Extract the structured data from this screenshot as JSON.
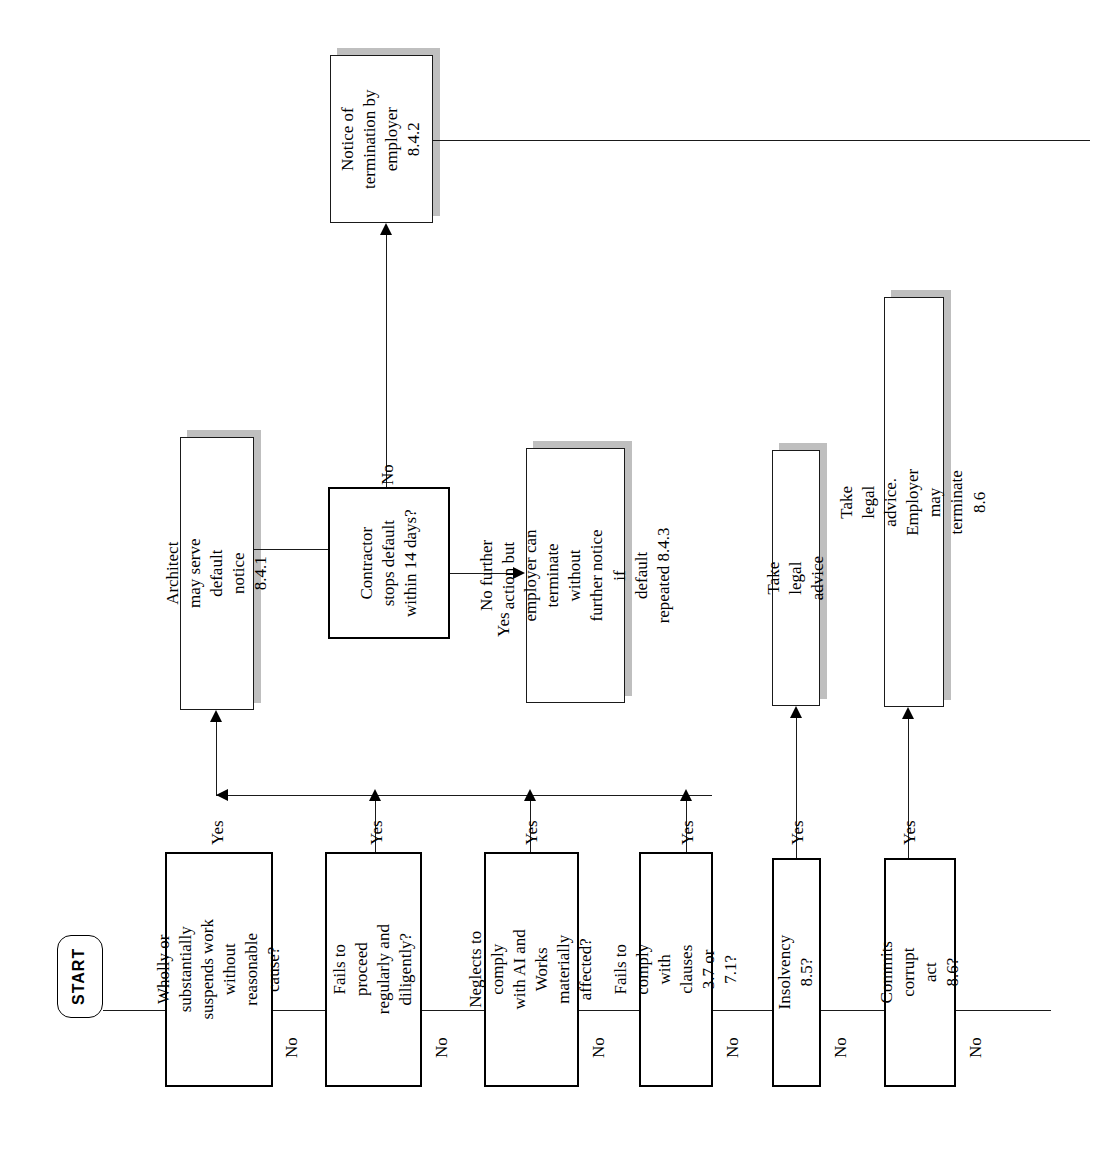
{
  "diagram": {
    "orientation": "landscape-rotated-text",
    "colors": {
      "stroke": "#1a1a1a",
      "shadow": "#bfbfbf",
      "background": "#ffffff",
      "text": "#000000"
    }
  },
  "nodes": {
    "start": {
      "label": "START",
      "shape": "terminator"
    },
    "notice_termination": {
      "label": "Notice of\ntermination by\nemployer 8.4.2",
      "shape": "process"
    },
    "architect_default_notice": {
      "label": "Architect may serve default\nnotice 8.4.1",
      "shape": "process"
    },
    "contractor_stops": {
      "label": "Contractor\nstops default\nwithin 14 days?",
      "shape": "question"
    },
    "no_further_action": {
      "label": "No further action but\nemployer can terminate\nwithout further notice if\ndefault repeated 8.4.3",
      "shape": "process"
    },
    "take_legal_advice": {
      "label": "Take legal advice",
      "shape": "process"
    },
    "take_legal_advice_terminate": {
      "label": "Take legal advice. Employer may terminate\n8.6",
      "shape": "process"
    },
    "q_suspends_work": {
      "label": "Wholly or substantially\nsuspends work without\nreasonable cause?",
      "shape": "decision"
    },
    "q_fails_proceed": {
      "label": "Fails to proceed\nregularly and\ndiligently?",
      "shape": "decision"
    },
    "q_neglects_ai": {
      "label": "Neglects to comply\nwith AI and Works\nmaterially affected?",
      "shape": "decision"
    },
    "q_fails_clauses": {
      "label": "Fails to comply with\nclauses 3.7 or 7.1?",
      "shape": "decision"
    },
    "q_insolvency": {
      "label": "Insolvency 8.5?",
      "shape": "decision"
    },
    "q_corrupt_act": {
      "label": "Commits corrupt act\n8.6?",
      "shape": "decision"
    }
  },
  "edge_labels": {
    "yes_suspends": "Yes",
    "yes_fails_proceed": "Yes",
    "yes_neglects": "Yes",
    "yes_fails_clauses": "Yes",
    "yes_insolvency": "Yes",
    "yes_corrupt": "Yes",
    "no_suspends": "No",
    "no_fails_proceed": "No",
    "no_neglects": "No",
    "no_fails_clauses": "No",
    "no_insolvency": "No",
    "no_corrupt": "No",
    "contractor_no": "No",
    "contractor_yes": "Yes"
  }
}
